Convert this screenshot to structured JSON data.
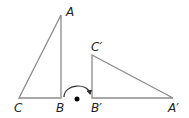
{
  "diagram": {
    "type": "geometry-rotation",
    "triangle_original": {
      "vertices": [
        {
          "name": "A",
          "x": 61,
          "y": 15
        },
        {
          "name": "B",
          "x": 61,
          "y": 98
        },
        {
          "name": "C",
          "x": 19,
          "y": 98
        }
      ]
    },
    "triangle_image": {
      "vertices": [
        {
          "name": "A'",
          "x": 173,
          "y": 98
        },
        {
          "name": "B'",
          "x": 92,
          "y": 98
        },
        {
          "name": "C'",
          "x": 92,
          "y": 55
        }
      ]
    },
    "labels": {
      "A": "A",
      "B": "B",
      "C": "C",
      "A_prime": "A′",
      "B_prime": "B′",
      "C_prime": "C′"
    },
    "rotation_arc": {
      "from": "B",
      "to": "B'",
      "center_dot": {
        "x": 77,
        "y": 99
      }
    },
    "colors": {
      "edge": "#8a8a8a",
      "label": "#231f20",
      "dot": "#000000"
    }
  }
}
